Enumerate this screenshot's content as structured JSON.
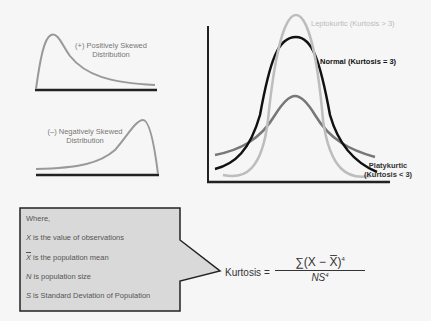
{
  "skew": {
    "positive_label_line1": "(+) Positively Skewed",
    "positive_label_line2": "Distribution",
    "negative_label_line1": "(–) Negatively Skewed",
    "negative_label_line2": "Distribution"
  },
  "kurtosis_chart": {
    "leptokurtic_label": "Leptokurtic  (Kurtosis > 3)",
    "normal_label": "Normal (Kurtosis = 3)",
    "platykurtic_label_line1": "Platykurtic",
    "platykurtic_label_line2": "(Kurtosis < 3)"
  },
  "legend": {
    "title": "Where,",
    "items": [
      {
        "symbol": "X",
        "text": " is the value of observations"
      },
      {
        "symbol": "X",
        "text": " is the population mean"
      },
      {
        "symbol": "N",
        "text": " is population size"
      },
      {
        "symbol": "S",
        "text": " is Standard Deviation of Population"
      }
    ]
  },
  "formula": {
    "lhs": "Kurtosis =",
    "numerator": "∑(X − X̅)",
    "numerator_exp": "4",
    "denominator": "NS",
    "denominator_exp": "4"
  },
  "colors": {
    "lepto": "#bdbdbd",
    "normal": "#111111",
    "platy": "#777777",
    "skew": "#999999",
    "legend_fill": "#d9d9d9"
  }
}
